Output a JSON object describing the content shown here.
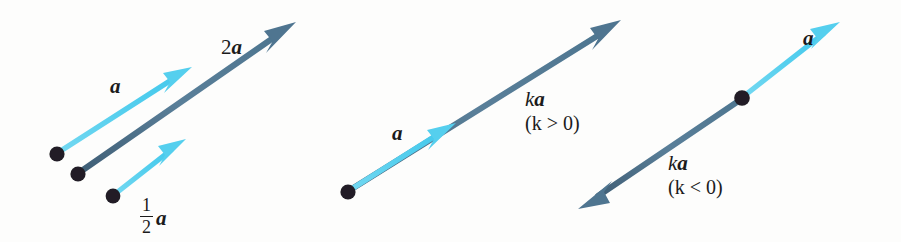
{
  "figure": {
    "width": 901,
    "height": 242,
    "background_color": "#fdfdfc"
  },
  "colors": {
    "vector_cyan": "#55CFEE",
    "vector_cyan_light": "#86DFF4",
    "vector_slate": "#5A7F99",
    "vector_slate_dark": "#4A6A83",
    "dot_black": "#201F25",
    "label_black": "#1b1b1b"
  },
  "panels": [
    {
      "id": "panel-scaled-copies",
      "labels": {
        "a": "a",
        "two_a_coefficient": "2",
        "two_a_vector": "a",
        "half_a_numerator": "1",
        "half_a_denominator": "2",
        "half_a_vector": "a"
      },
      "arrows": [
        {
          "name": "vector-a",
          "color": "#55CFEE",
          "label": "a",
          "from": [
            57,
            154
          ],
          "to": [
            192,
            67
          ]
        },
        {
          "name": "vector-2a",
          "color": "#5A7F99",
          "label": "2a",
          "from": [
            78,
            174
          ],
          "to": [
            296,
            22
          ]
        },
        {
          "name": "vector-half-a",
          "color": "#55CFEE",
          "label": "1/2 a",
          "from": [
            113,
            196
          ],
          "to": [
            186,
            139
          ]
        }
      ],
      "dots": [
        [
          57,
          154
        ],
        [
          78,
          174
        ],
        [
          113,
          196
        ]
      ]
    },
    {
      "id": "panel-k-positive",
      "labels": {
        "a": "a",
        "ka_scalar": "k",
        "ka_vector": "a",
        "condition": "(k > 0)"
      },
      "arrows": [
        {
          "name": "vector-a",
          "color": "#55CFEE",
          "label": "a",
          "from": [
            348,
            192
          ],
          "to": [
            456,
            123
          ]
        },
        {
          "name": "vector-ka",
          "color": "#5A7F99",
          "label": "ka",
          "from": [
            348,
            192
          ],
          "to": [
            621,
            20
          ]
        }
      ],
      "dots": [
        [
          348,
          192
        ]
      ]
    },
    {
      "id": "panel-k-negative",
      "labels": {
        "a": "a",
        "ka_scalar": "k",
        "ka_vector": "a",
        "condition": "(k < 0)"
      },
      "arrows": [
        {
          "name": "vector-a",
          "color": "#55CFEE",
          "label": "a",
          "from": [
            742,
            98
          ],
          "to": [
            840,
            22
          ]
        },
        {
          "name": "vector-ka",
          "color": "#5A7F99",
          "label": "ka",
          "from": [
            742,
            98
          ],
          "to": [
            578,
            209
          ]
        }
      ],
      "dots": [
        [
          742,
          98
        ]
      ]
    }
  ]
}
